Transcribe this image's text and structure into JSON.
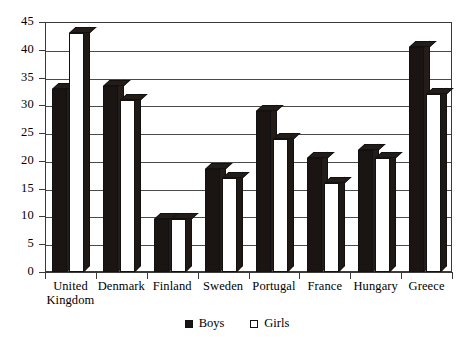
{
  "chart_data": {
    "type": "bar",
    "title": "",
    "subtitle": "",
    "xlabel": "",
    "ylabel": "",
    "ylim": [
      0,
      45
    ],
    "yticks": [
      0,
      5,
      10,
      15,
      20,
      25,
      30,
      35,
      40,
      45
    ],
    "ytick_labels": [
      "0",
      "5",
      "10",
      "15",
      "20",
      "25",
      "30",
      "35",
      "40",
      "45"
    ],
    "grid": true,
    "grid_axis": "y",
    "legend_position": "bottom-center",
    "categories": [
      "United Kingdom",
      "Denmark",
      "Finland",
      "Sweden",
      "Portugal",
      "France",
      "Hungary",
      "Greece"
    ],
    "category_lines": [
      [
        "United",
        "Kingdom"
      ],
      [
        "Denmark",
        ""
      ],
      [
        "Finland",
        ""
      ],
      [
        "Sweden",
        ""
      ],
      [
        "Portugal",
        ""
      ],
      [
        "France",
        ""
      ],
      [
        "Hungary",
        ""
      ],
      [
        "Greece",
        ""
      ]
    ],
    "series": [
      {
        "name": "Boys",
        "color": "#1a1412",
        "values": [
          33,
          33.5,
          9.5,
          18.5,
          29,
          20.5,
          22,
          40.5
        ]
      },
      {
        "name": "Girls",
        "color": "#ffffff",
        "values": [
          43,
          31,
          9.5,
          17,
          24,
          16,
          20.5,
          32
        ]
      }
    ],
    "legend": [
      "Boys",
      "Girls"
    ]
  },
  "legend": {
    "items": [
      {
        "label": "Boys",
        "swatch": "filled-square-icon"
      },
      {
        "label": "Girls",
        "swatch": "empty-square-icon"
      }
    ]
  }
}
